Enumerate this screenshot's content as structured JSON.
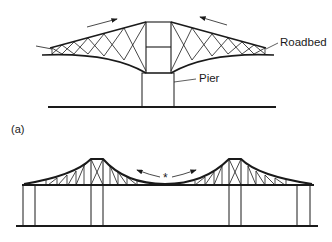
{
  "figure": {
    "top": {
      "labels": {
        "roadbed": "Roadbed",
        "pier": "Pier"
      },
      "arrows": [
        "arrow-toward-center-left",
        "arrow-toward-center-right"
      ]
    },
    "panel_label": "(a)",
    "bottom": {
      "center_mark": "*",
      "arrows": [
        "arrow-outward-left",
        "arrow-outward-right"
      ]
    },
    "colors": {
      "line": "#1a1a1a",
      "background": "#ffffff"
    }
  }
}
